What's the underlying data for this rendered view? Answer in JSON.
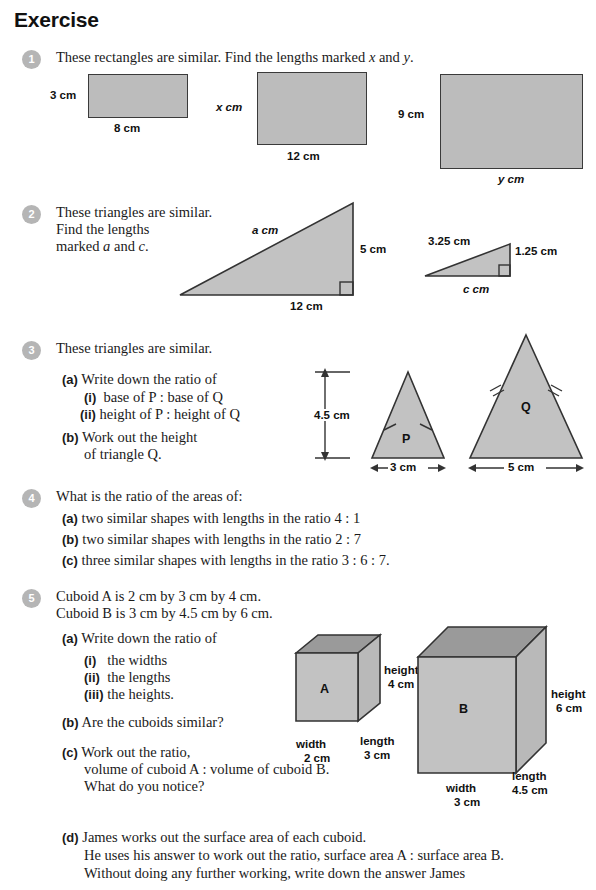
{
  "header": {
    "title": "Exercise"
  },
  "questions": [
    {
      "number": "1",
      "stem": "These rectangles are similar. Find the lengths marked x and y.",
      "diagram": {
        "rect_small": {
          "height_label": "3 cm",
          "base_label": "8 cm"
        },
        "rect_mid": {
          "height_label": "x cm",
          "base_label": "12 cm"
        },
        "rect_large": {
          "height_label": "9 cm",
          "base_label": "y cm"
        }
      }
    },
    {
      "number": "2",
      "stem_line1": "These triangles are similar.",
      "stem_line2": "Find the lengths",
      "stem_line3": "marked a and c.",
      "diagram": {
        "big_triangle": {
          "hyp_label": "a cm",
          "vertical_label": "5 cm",
          "base_label": "12 cm"
        },
        "small_triangle": {
          "hyp_label": "3.25 cm",
          "vertical_label": "1.25 cm",
          "base_label": "c cm"
        }
      }
    },
    {
      "number": "3",
      "stem": "These triangles are similar.",
      "parts": [
        {
          "label": "(a)",
          "text": "Write down the ratio of"
        },
        {
          "label": "(i)",
          "text": "base of P : base of Q"
        },
        {
          "label": "(ii)",
          "text": "height of P : height of Q"
        },
        {
          "label": "(b)",
          "text_line1": "Work out the height",
          "text_line2": "of triangle Q."
        }
      ],
      "diagram": {
        "height_label": "4.5 cm",
        "triangle_p": {
          "letter": "P",
          "base_label": "3 cm"
        },
        "triangle_q": {
          "letter": "Q",
          "base_label": "5 cm"
        }
      }
    },
    {
      "number": "4",
      "stem": "What is the ratio of the areas of:",
      "parts": [
        {
          "label": "(a)",
          "text": "two similar shapes with lengths in the ratio 4 : 1"
        },
        {
          "label": "(b)",
          "text": "two similar shapes with lengths in the ratio 2 : 7"
        },
        {
          "label": "(c)",
          "text": "three similar shapes with lengths in the ratio 3 : 6 : 7."
        }
      ]
    },
    {
      "number": "5",
      "stem_line1": "Cuboid A is 2 cm by 3 cm by 4 cm.",
      "stem_line2": "Cuboid B is 3 cm by 4.5 cm by 6 cm.",
      "parts": [
        {
          "label": "(a)",
          "text": "Write down the ratio of"
        },
        {
          "label": "(i)",
          "text": "the widths"
        },
        {
          "label": "(ii)",
          "text": "the lengths"
        },
        {
          "label": "(iii)",
          "text": "the heights."
        },
        {
          "label": "(b)",
          "text": "Are the cuboids similar?"
        },
        {
          "label": "(c)",
          "text_line1": "Work out the ratio,",
          "text_line2": "volume of cuboid A : volume of cuboid B.",
          "text_line3": "What do you notice?"
        },
        {
          "label": "(d)",
          "text_line1": "James works out the surface area of each cuboid.",
          "text_line2": "He uses his answer to work out the ratio, surface area A : surface area B.",
          "text_line3": "Without doing any further working, write down the answer James"
        }
      ],
      "diagram": {
        "cuboid_a": {
          "letter": "A",
          "height_label_line1": "height",
          "height_label_line2": "4 cm",
          "length_label_line1": "length",
          "length_label_line2": "3 cm",
          "width_label_line1": "width",
          "width_label_line2": "2 cm"
        },
        "cuboid_b": {
          "letter": "B",
          "height_label_line1": "height",
          "height_label_line2": "6 cm",
          "length_label_line1": "length",
          "length_label_line2": "4.5 cm",
          "width_label_line1": "width",
          "width_label_line2": "3 cm"
        }
      }
    }
  ],
  "colors": {
    "badge_gray": "#b5b5b5",
    "shape_fill": "#bcbcbc",
    "shape_fill_dark": "#9a9a9a",
    "stroke": "#333333",
    "text": "#1a1a1a"
  }
}
